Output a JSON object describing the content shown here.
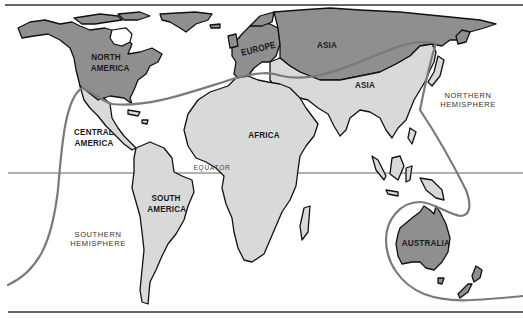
{
  "map": {
    "colors": {
      "dark_land": "#8f8f8f",
      "light_land": "#d9d9d9",
      "outline": "#111111",
      "route_line": "#7a7a7a",
      "background": "#ffffff"
    },
    "labels": {
      "north_america": "NORTH\nAMERICA",
      "central_america": "CENTRAL\nAMERICA",
      "south_america": "SOUTH\nAMERICA",
      "europe": "EUROPE",
      "asia_north": "ASIA",
      "asia_south": "ASIA",
      "africa": "AFRICA",
      "australia": "AUSTRALIA",
      "northern_hemisphere": "NORTHERN\nHEMISPHERE",
      "southern_hemisphere": "SOUTHERN\nHEMISPHERE",
      "equator": "EQUATOR"
    },
    "regions": {
      "dark": [
        "North America",
        "Europe",
        "Northern Asia",
        "Australia",
        "New Zealand",
        "Greenland"
      ],
      "light": [
        "Central America",
        "South America",
        "Africa",
        "Southern Asia",
        "Southeast Asia islands",
        "Madagascar"
      ]
    }
  }
}
